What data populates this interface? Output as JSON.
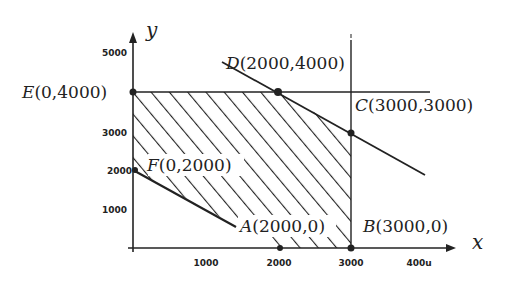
{
  "diagram": {
    "type": "linear-programming-feasible-region",
    "axes": {
      "x_label": "x",
      "y_label": "y",
      "x_ticks": [
        "1000",
        "2000",
        "3000",
        "400u"
      ],
      "y_ticks": [
        "5000",
        "3000",
        "2000",
        "1000"
      ]
    },
    "points": {
      "E": {
        "name": "E",
        "label": "E(0,4000)",
        "x": 0,
        "y": 4000
      },
      "D": {
        "name": "D",
        "label": "D(2000,4000)",
        "x": 2000,
        "y": 4000
      },
      "C": {
        "name": "C",
        "label": "C(3000,3000)",
        "x": 3000,
        "y": 3000
      },
      "F": {
        "name": "F",
        "label": "F(0,2000)",
        "x": 0,
        "y": 2000
      },
      "A": {
        "name": "A",
        "label": "A(2000,0)",
        "x": 2000,
        "y": 0
      },
      "B": {
        "name": "B",
        "label": "B(3000,0)",
        "x": 3000,
        "y": 0
      }
    },
    "labels": {
      "E": {
        "letter": "E",
        "coords": "(0,4000)"
      },
      "D": {
        "letter": "D",
        "coords": "(2000,4000)"
      },
      "C": {
        "letter": "C",
        "coords": "(3000,3000)"
      },
      "F": {
        "letter": "F",
        "coords": "(0,2000)"
      },
      "A": {
        "letter": "A",
        "coords": "(2000,0)"
      },
      "B": {
        "letter": "B",
        "coords": "(3000,0)"
      }
    },
    "constraint_lines": [
      {
        "description": "y = 4000 (horizontal line through E and D)"
      },
      {
        "description": "x = 3000 (vertical line through B and C)"
      },
      {
        "description": "line through D(2000,4000) and C(3000,3000)"
      },
      {
        "description": "line through F(0,2000) toward A(2000,0)"
      }
    ],
    "feasible_region": {
      "vertices": [
        "E",
        "D",
        "C",
        "B",
        "A",
        "F"
      ],
      "fill": "diagonal hatching"
    },
    "colors": {
      "ink": "#222222",
      "background": "#ffffff"
    }
  }
}
